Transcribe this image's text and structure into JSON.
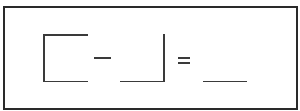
{
  "puzzle": {
    "description": "Shape subtraction puzzle",
    "operand_a": "open-bracket shape (top, left, bottom edges)",
    "operator_1": "−",
    "operand_b": "corner shape (bottom and right edges)",
    "operator_2": "=",
    "answer": "blank",
    "colors": {
      "stroke": "#3a3a3a",
      "frame": "#2a2a2a",
      "background": "#ffffff"
    }
  }
}
